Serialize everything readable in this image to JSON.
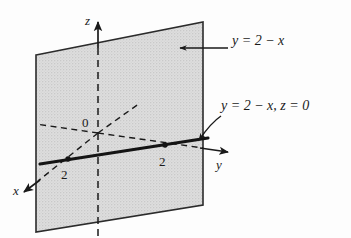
{
  "figure": {
    "kind": "3d-coordinate-plane-diagram",
    "colors": {
      "ink": "#1a1a1a",
      "plane_fill": "#d9d9d9",
      "plane_edge": "#2b2b2b",
      "background": "#fdfdfd"
    },
    "axes": [
      {
        "name": "x-axis",
        "label": "x",
        "label_x": 14,
        "label_y": 185,
        "direction": "down-left-toward-viewer"
      },
      {
        "name": "y-axis",
        "label": "y",
        "label_x": 216,
        "label_y": 160,
        "direction": "right"
      },
      {
        "name": "z-axis",
        "label": "z",
        "label_x": 85,
        "label_y": 14,
        "direction": "up"
      }
    ],
    "origin": {
      "label": "0",
      "label_x": 83,
      "label_y": 118,
      "point_x": 98,
      "point_y": 133
    },
    "ticks": [
      {
        "name": "x-intercept-tick",
        "label": "2",
        "label_x": 62,
        "label_y": 172,
        "point_x": 68,
        "point_y": 158
      },
      {
        "name": "y-intercept-tick",
        "label": "2",
        "label_x": 160,
        "label_y": 158,
        "point_x": 165,
        "point_y": 145
      }
    ],
    "annotations": [
      {
        "name": "plane-equation",
        "text": "y = 2 − x",
        "text_x": 232,
        "text_y": 40,
        "arrow_from_x": 228,
        "arrow_from_y": 48,
        "arrow_to_x": 177,
        "arrow_to_y": 48,
        "arrow_style": "straight"
      },
      {
        "name": "trace-line-equation",
        "text": "y = 2 − x, z = 0",
        "text_x": 222,
        "text_y": 106,
        "arrow_from_x": 219,
        "arrow_from_y": 117,
        "arrow_to_x": 198,
        "arrow_to_y": 141,
        "arrow_style": "curved"
      }
    ],
    "plane_corners": {
      "top_left_x": 36,
      "top_left_y": 55,
      "top_right_x": 203,
      "top_right_y": 22,
      "bottom_right_x": 203,
      "bottom_right_y": 205,
      "bottom_left_x": 36,
      "bottom_left_y": 232
    },
    "trace_line": {
      "name": "trace-line",
      "from_x": 40,
      "from_y": 164,
      "to_x": 208,
      "to_y": 138
    }
  }
}
